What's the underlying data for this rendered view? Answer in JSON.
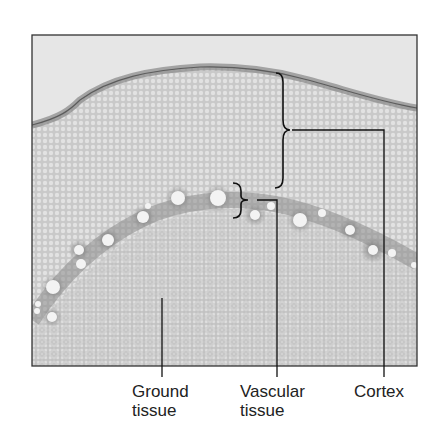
{
  "figure": {
    "colors": {
      "background": "#ffffff",
      "slide_background": "#e4e4e4",
      "tissue": "#cfcfcf",
      "epidermis": "#8a8a8a",
      "vascular_ring": "#7a7a7a",
      "vessel": "#f4f4f4",
      "frame": "#333333",
      "leader_line": "#111111"
    },
    "frame": {
      "x": 32,
      "y": 35,
      "width": 385,
      "height": 331
    }
  },
  "labels": [
    {
      "id": "ground",
      "line1": "Ground",
      "line2": "tissue"
    },
    {
      "id": "vascular",
      "line1": "Vascular",
      "line2": "tissue"
    },
    {
      "id": "cortex",
      "line1": "Cortex",
      "line2": ""
    }
  ]
}
